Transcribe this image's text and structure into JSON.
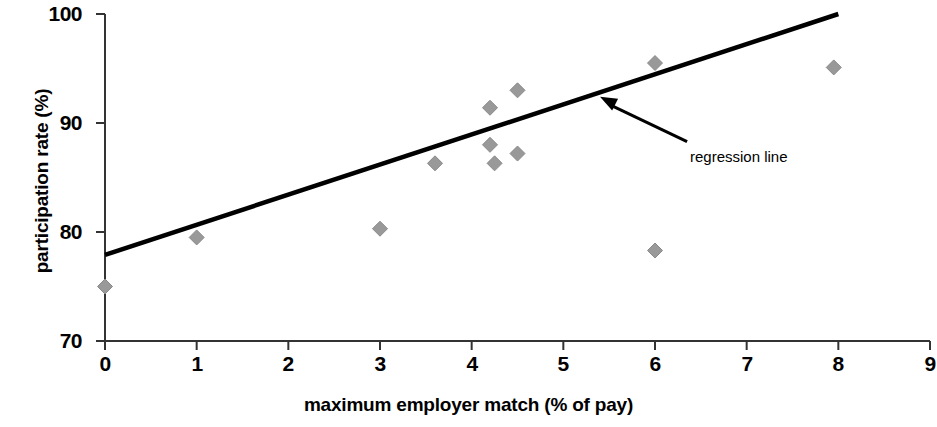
{
  "chart_data": {
    "type": "scatter",
    "title": "",
    "subtitle": "",
    "xlabel": "maximum employer match (% of pay)",
    "ylabel": "participation rate (%)",
    "xlim": [
      0,
      9
    ],
    "ylim": [
      70,
      100
    ],
    "xticks": [
      "0",
      "1",
      "2",
      "3",
      "4",
      "5",
      "6",
      "7",
      "8",
      "9"
    ],
    "xtick_values": [
      0,
      1,
      2,
      3,
      4,
      5,
      6,
      7,
      8,
      9
    ],
    "yticks": [
      "70",
      "80",
      "90",
      "100"
    ],
    "ytick_values": [
      70,
      80,
      90,
      100
    ],
    "grid": false,
    "legend": false,
    "series": [
      {
        "name": "plan observations",
        "marker": "diamond",
        "color": "#999999",
        "points": [
          {
            "x": 0.0,
            "y": 75.0
          },
          {
            "x": 1.0,
            "y": 79.5
          },
          {
            "x": 3.0,
            "y": 80.3
          },
          {
            "x": 3.6,
            "y": 86.3
          },
          {
            "x": 4.2,
            "y": 91.4
          },
          {
            "x": 4.2,
            "y": 88.0
          },
          {
            "x": 4.25,
            "y": 86.3
          },
          {
            "x": 4.5,
            "y": 93.0
          },
          {
            "x": 4.5,
            "y": 87.2
          },
          {
            "x": 6.0,
            "y": 95.5
          },
          {
            "x": 6.0,
            "y": 78.3
          },
          {
            "x": 7.95,
            "y": 95.1
          }
        ]
      }
    ],
    "trendline": {
      "name": "regression line",
      "color": "#000000",
      "x_start": 0.0,
      "y_start": 77.9,
      "x_end": 8.0,
      "y_end": 100.0
    },
    "annotations": [
      {
        "text": "regression line",
        "target_x": 5.4,
        "target_y": 92.4,
        "text_x": 6.35,
        "text_y": 88.3
      }
    ]
  },
  "axes": {
    "y_title": "participation rate (%)",
    "x_title": "maximum employer match (% of pay)"
  }
}
